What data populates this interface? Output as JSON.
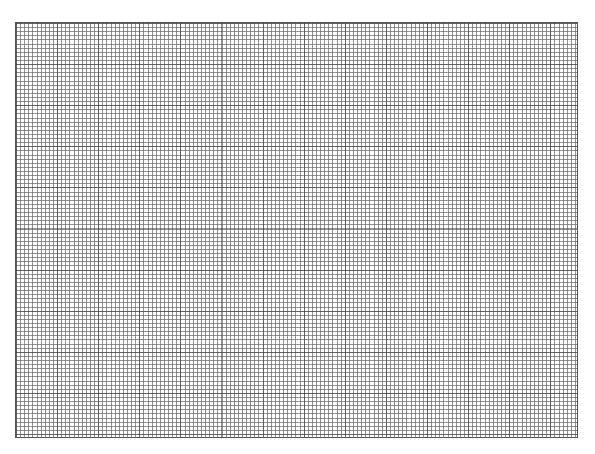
{
  "page": {
    "header_fragment": "",
    "background_color": "#ffffff"
  },
  "grid": {
    "columns": 137,
    "rows": 101,
    "cell_size_px": 4.1,
    "major_every": 10,
    "line_color": "#5a5a5a",
    "border_color": "#555555"
  }
}
